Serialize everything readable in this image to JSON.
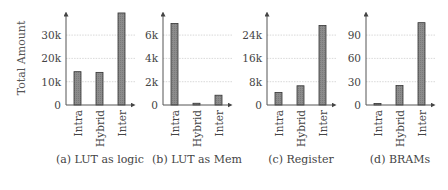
{
  "figure": {
    "ylabel": "Total Amount",
    "categories": [
      "Intra",
      "Hybrid",
      "Inter"
    ],
    "bar_color": "#8a8a8a",
    "bar_edge_color": "#333333"
  },
  "chart_data": [
    {
      "type": "bar",
      "title": "(a) LUT as logic",
      "xlabel": "",
      "ylabel": "Total Amount",
      "categories": [
        "Intra",
        "Hybrid",
        "Inter"
      ],
      "values": [
        14300,
        14000,
        39500
      ],
      "yticks": [
        0,
        10000,
        20000,
        30000
      ],
      "ytick_labels": [
        "0",
        "10k",
        "20k",
        "30k"
      ],
      "ylim": [
        0,
        40000
      ],
      "grid": true,
      "legend": null
    },
    {
      "type": "bar",
      "title": "(b) LUT as Mem",
      "xlabel": "",
      "ylabel": "",
      "categories": [
        "Intra",
        "Hybrid",
        "Inter"
      ],
      "values": [
        7000,
        150,
        840
      ],
      "yticks": [
        0,
        2000,
        4000,
        6000
      ],
      "ytick_labels": [
        "0",
        "2k",
        "4k",
        "6k"
      ],
      "ylim": [
        0,
        7900
      ],
      "grid": true,
      "legend": null
    },
    {
      "type": "bar",
      "title": "(c) Register",
      "xlabel": "",
      "ylabel": "",
      "categories": [
        "Intra",
        "Hybrid",
        "Inter"
      ],
      "values": [
        4300,
        6600,
        27300
      ],
      "yticks": [
        0,
        8000,
        16000,
        24000
      ],
      "ytick_labels": [
        "0",
        "8k",
        "16k",
        "24k"
      ],
      "ylim": [
        0,
        30500
      ],
      "grid": true,
      "legend": null
    },
    {
      "type": "bar",
      "title": "(d) BRAMs",
      "xlabel": "",
      "ylabel": "",
      "categories": [
        "Intra",
        "Hybrid",
        "Inter"
      ],
      "values": [
        2,
        25,
        106
      ],
      "yticks": [
        0,
        30,
        60,
        90
      ],
      "ytick_labels": [
        "0",
        "30",
        "60",
        "90"
      ],
      "ylim": [
        0,
        118
      ],
      "grid": true,
      "legend": null
    }
  ]
}
